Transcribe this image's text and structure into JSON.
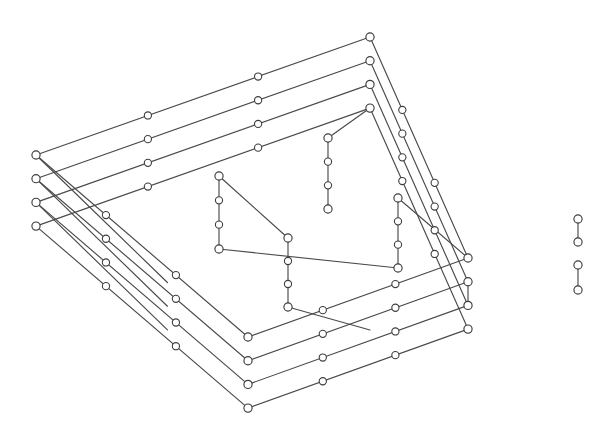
{
  "figure": {
    "background_color": "#ffffff",
    "edge_color": "#4a4a4a",
    "node_fill_color": "#ffffff",
    "node_stroke_color": "#3d3d3d",
    "node_radius": 4.1,
    "node_radius_small": 3.6,
    "edge_width": 1.15,
    "layer_count": 4,
    "layer_offset_y": 23.7,
    "canvas": {
      "width": 616,
      "height": 434
    }
  },
  "chart_data": {
    "type": "scatter",
    "xlabel": "",
    "ylabel": "",
    "xlim": [
      0,
      616
    ],
    "ylim": [
      0,
      434
    ],
    "grid": false,
    "legend": "none",
    "layers": [
      {
        "name": "layer-1",
        "dy": 0,
        "corners": {
          "west": [
            36,
            155
          ],
          "north": [
            370,
            37
          ],
          "east": [
            468,
            258
          ],
          "south": [
            248,
            337
          ]
        }
      },
      {
        "name": "layer-2",
        "dy": 23.7,
        "corners": {
          "west": [
            36,
            178.7
          ],
          "north": [
            370,
            60.7
          ],
          "east": [
            468,
            281.7
          ],
          "south": [
            248,
            360.7
          ]
        }
      },
      {
        "name": "layer-3",
        "dy": 47.4,
        "corners": {
          "west": [
            36,
            202.4
          ],
          "north": [
            370,
            84.4
          ],
          "east": [
            468,
            305.4
          ],
          "south": [
            248,
            384.4
          ]
        }
      },
      {
        "name": "layer-4",
        "dy": 71.1,
        "corners": {
          "west": [
            36,
            226.1
          ],
          "north": [
            370,
            108.1
          ],
          "east": [
            468,
            329.1
          ],
          "south": [
            248,
            408.1
          ]
        }
      }
    ],
    "ring_edge_nodes": {
      "west_to_north_intermediate_t": [
        0.335,
        0.665
      ],
      "north_to_east_intermediate_t": [
        0.33,
        0.66
      ],
      "west_to_south_intermediate_t": [
        0.33,
        0.66
      ],
      "south_to_east_intermediate_t": [
        0.34,
        0.67
      ]
    },
    "inner_structure": {
      "columns": [
        {
          "name": "inner-column-left",
          "x": 219,
          "y_top": 176,
          "y_bottom": 249,
          "node_count": 4
        },
        {
          "name": "inner-column-mid",
          "x": 288,
          "y_top": 238,
          "y_bottom": 307,
          "node_count": 4
        },
        {
          "name": "inner-column-upper-right",
          "x": 328,
          "y_top": 138,
          "y_bottom": 209,
          "node_count": 4
        },
        {
          "name": "inner-column-right",
          "x": 398,
          "y_top": 198,
          "y_bottom": 268,
          "node_count": 4
        }
      ],
      "diagonals": [
        {
          "name": "diag-left-top-to-mid-top",
          "from": [
            219,
            176
          ],
          "to": [
            288,
            238
          ]
        },
        {
          "name": "diag-left-bottom-to-right-mid",
          "from": [
            219,
            249
          ],
          "to": [
            398,
            268
          ]
        },
        {
          "name": "diag-mid-bottom-to-south",
          "from": [
            288,
            307
          ],
          "to": [
            370,
            330
          ]
        },
        {
          "name": "diag-upper-right-to-north",
          "from": [
            328,
            138
          ],
          "to": [
            370,
            108
          ]
        },
        {
          "name": "diag-right-top-to-east",
          "from": [
            398,
            198
          ],
          "to": [
            468,
            258
          ]
        }
      ]
    },
    "right_detached_pairs": [
      {
        "name": "right-pair-upper",
        "top": [
          578,
          219
        ],
        "bottom": [
          578,
          242
        ]
      },
      {
        "name": "right-pair-lower",
        "top": [
          578,
          265
        ],
        "bottom": [
          578,
          290
        ]
      }
    ],
    "node_total_estimate": 96
  }
}
